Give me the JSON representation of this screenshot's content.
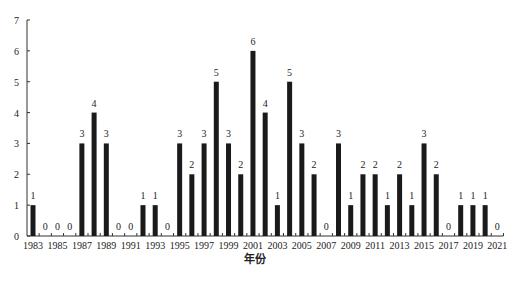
{
  "chart_data": {
    "type": "bar",
    "title": "",
    "xlabel": "年份",
    "ylabel": "",
    "ylim": [
      0,
      7
    ],
    "yticks": [
      0,
      1,
      2,
      3,
      4,
      5,
      6,
      7
    ],
    "grid": false,
    "legend": null,
    "categories": [
      "1983",
      "1984",
      "1985",
      "1986",
      "1987",
      "1988",
      "1989",
      "1990",
      "1991",
      "1992",
      "1993",
      "1994",
      "1995",
      "1996",
      "1997",
      "1998",
      "1999",
      "2000",
      "2001",
      "2002",
      "2003",
      "2004",
      "2005",
      "2006",
      "2007",
      "2008",
      "2009",
      "2010",
      "2011",
      "2012",
      "2013",
      "2014",
      "2015",
      "2016",
      "2017",
      "2018",
      "2019",
      "2020",
      "2021"
    ],
    "xtick_labels": [
      "1983",
      "1985",
      "1987",
      "1989",
      "1991",
      "1993",
      "1995",
      "1997",
      "1999",
      "2001",
      "2003",
      "2005",
      "2007",
      "2009",
      "2011",
      "2013",
      "2015",
      "2017",
      "2019",
      "2021"
    ],
    "values": [
      1,
      0,
      0,
      0,
      3,
      4,
      3,
      0,
      0,
      1,
      1,
      0,
      3,
      2,
      3,
      5,
      3,
      2,
      6,
      4,
      1,
      5,
      3,
      2,
      0,
      3,
      1,
      2,
      2,
      1,
      2,
      1,
      3,
      2,
      0,
      1,
      1,
      1,
      0
    ],
    "data_labels": true,
    "bar_color": "#1a1a1a"
  }
}
